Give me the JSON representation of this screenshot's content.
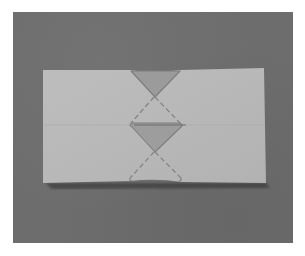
{
  "image": {
    "description": "Photograph of a rectangular sheet of light gray paper on a dark gray surface, folded so that a vertical column of triangular flaps and dashed crease lines forms in the center.",
    "colors": {
      "outer_border": "#ffffff",
      "backdrop": "#6d6d6d",
      "paper": "#b9b9b9",
      "paper_shade": "#b3b3b3",
      "flap_fill": "#9a9a9a",
      "crease_line": "#7c7c7c",
      "shadow": "#3a3a3a"
    },
    "paper": {
      "corners": [
        [
          43,
          70
        ],
        [
          264,
          68
        ],
        [
          266,
          183
        ],
        [
          43,
          183
        ]
      ]
    },
    "flaps": [
      {
        "name": "top-triangle",
        "points": [
          [
            130,
            70
          ],
          [
            180,
            70
          ],
          [
            154,
            96
          ]
        ]
      },
      {
        "name": "middle-triangle",
        "points": [
          [
            130,
            126
          ],
          [
            182,
            126
          ],
          [
            154,
            152
          ]
        ]
      }
    ],
    "creases": [
      {
        "name": "upper-left-diagonal",
        "from": [
          154,
          96
        ],
        "to": [
          130,
          124
        ]
      },
      {
        "name": "upper-right-diagonal",
        "from": [
          154,
          96
        ],
        "to": [
          180,
          124
        ]
      },
      {
        "name": "lower-left-diagonal",
        "from": [
          154,
          152
        ],
        "to": [
          130,
          178
        ]
      },
      {
        "name": "lower-right-diagonal",
        "from": [
          154,
          152
        ],
        "to": [
          180,
          178
        ]
      },
      {
        "name": "horizontal-crease",
        "from": [
          43,
          125
        ],
        "to": [
          266,
          125
        ]
      }
    ]
  }
}
